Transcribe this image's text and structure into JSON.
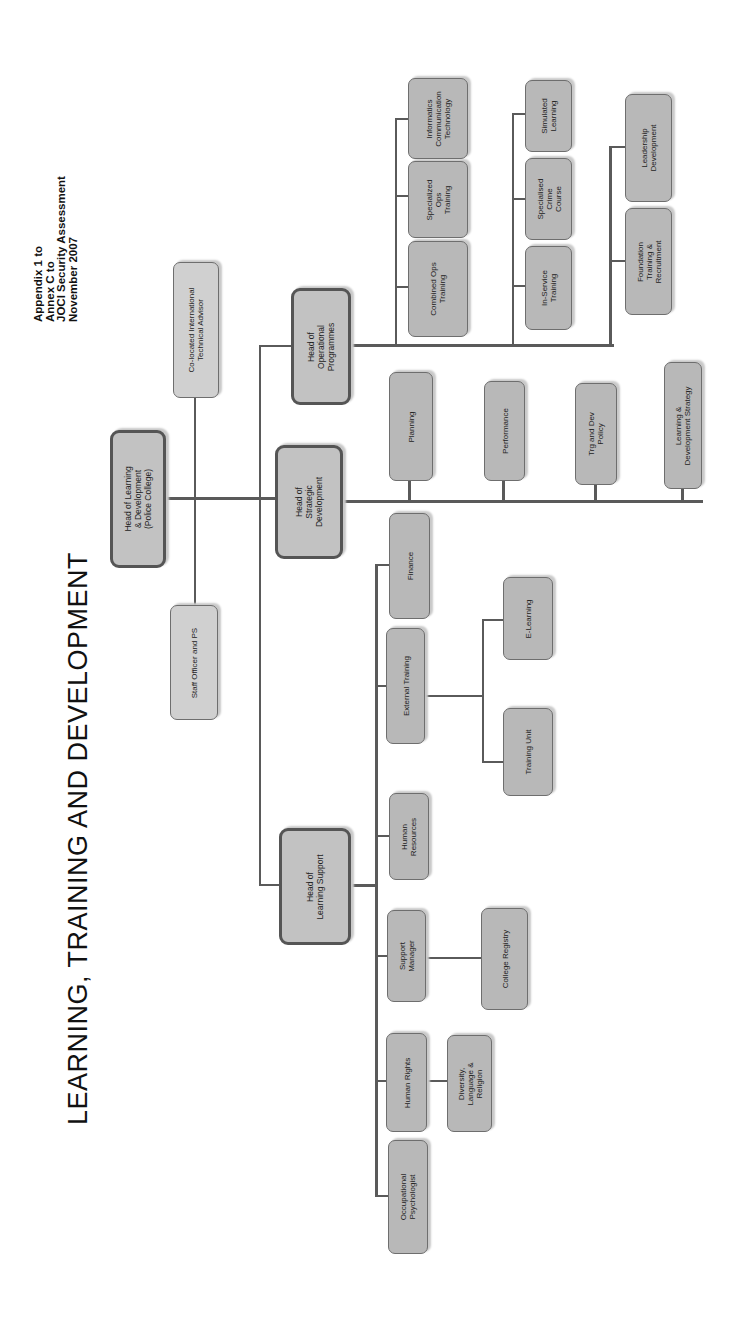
{
  "title": "LEARNING, TRAINING AND DEVELOPMENT",
  "appendix": {
    "line1": "Appendix 1 to",
    "line2": "Annex C to",
    "line3": "JOCI Security Assessment",
    "line4": "November 2007"
  },
  "nodes": {
    "head_ld": "Head of Learning\n& Development\n(Police College)",
    "co_located": "Co-located International\nTechnical Advisor",
    "staff_officer": "Staff Officer and PS",
    "head_ops": "Head of\nOperational\nProgrammes",
    "head_strategic": "Head of\nStrategic\nDevelopment",
    "head_support": "Head of\nLearning Support",
    "combined_ops": "Combined Ops\nTraining",
    "specialized_ops": "Specialized\nOps\nTraining",
    "ict": "Informatics\nCommunication\nTechnology",
    "in_service": "In-Service\nTraining",
    "specialised_crime": "Specialised\nCrime\nCourse",
    "simulated": "Simulated\nLearning",
    "foundation": "Foundation\nTraining &\nRecruitment",
    "leadership": "Leadership\nDevelopment",
    "planning": "Planning",
    "performance": "Performance",
    "trg_policy": "Trg and Dev\nPolicy",
    "ld_strategy": "Learning &\nDevelopment Strategy",
    "finance": "Finance",
    "external_training": "External Training",
    "e_learning": "E-Learning",
    "training_unit": "Training Unit",
    "human_resources": "Human\nResources",
    "support_manager": "Support\nManager",
    "college_registry": "College Registry",
    "human_rights": "Human Rights",
    "diversity": "Diversity,\nLanguage &\nReligion",
    "occ_psych": "Occupational\nPsychologist"
  }
}
